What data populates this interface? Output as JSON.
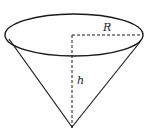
{
  "diagram": {
    "type": "cone",
    "labels": {
      "radius": "R",
      "height": "h"
    },
    "colors": {
      "stroke": "#1a1a1a",
      "background": "#ffffff"
    }
  }
}
